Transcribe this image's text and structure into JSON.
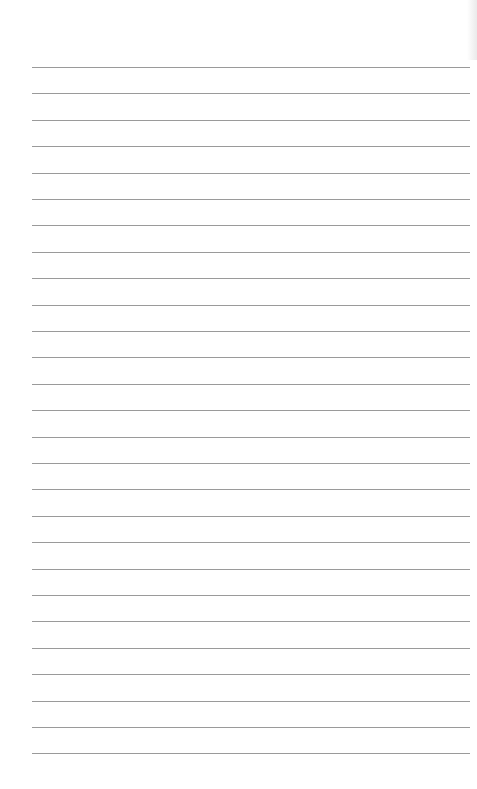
{
  "page": {
    "type": "lined-paper",
    "background_color": "#ffffff",
    "line_color": "#9a9a9a",
    "line_count": 27,
    "first_line_y": 67,
    "line_spacing": 26.4,
    "line_left_x": 32,
    "line_right_x": 470
  }
}
